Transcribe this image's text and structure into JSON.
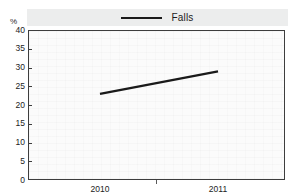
{
  "chart_data": {
    "type": "line",
    "title": "",
    "xlabel": "",
    "ylabel": "%",
    "unit_label": "%",
    "categories": [
      "2010",
      "2011"
    ],
    "x": [
      2010,
      2011
    ],
    "series": [
      {
        "name": "Falls",
        "values": [
          23,
          29
        ],
        "color": "#1a1a1a"
      }
    ],
    "ylim": [
      0,
      40
    ],
    "yticks": [
      0,
      5,
      10,
      15,
      20,
      25,
      30,
      35,
      40
    ],
    "ytick_labels": [
      "0",
      "5",
      "10",
      "15",
      "20",
      "25",
      "30",
      "35",
      "40"
    ],
    "xticks": [
      "2010",
      "2011"
    ],
    "grid": false,
    "legend_position": "top",
    "legend_entries": [
      "Falls"
    ]
  },
  "legend": {
    "entries": [
      {
        "label": "Falls",
        "icon": "line-swatch-icon",
        "color": "#1a1a1a"
      }
    ]
  },
  "axes": {
    "y_unit": "%",
    "y_labels": [
      "40",
      "35",
      "30",
      "25",
      "20",
      "15",
      "10",
      "5",
      "0"
    ],
    "x_labels": [
      "2010",
      "2011"
    ]
  },
  "colors": {
    "series_line": "#1a1a1a",
    "frame": "#3d3d3d",
    "legend_band": "#eceded",
    "plot_background": "#fbfbfb",
    "text": "#222222"
  }
}
